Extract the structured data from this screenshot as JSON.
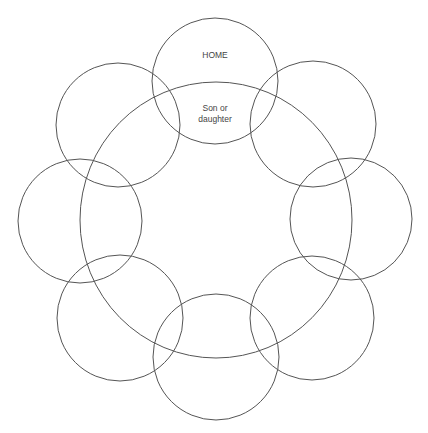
{
  "diagram": {
    "type": "overlapping-circles",
    "stroke_color": "#555555",
    "background": "#ffffff",
    "central_ellipse": {
      "cx": 216,
      "cy": 220,
      "rx": 136,
      "ry": 138
    },
    "circles": [
      {
        "id": "top",
        "cx": 215,
        "cy": 81,
        "r": 63,
        "label": "HOME"
      },
      {
        "id": "top-right",
        "cx": 313,
        "cy": 124,
        "r": 63,
        "label": ""
      },
      {
        "id": "right",
        "cx": 351,
        "cy": 219,
        "r": 61,
        "label": ""
      },
      {
        "id": "bottom-right",
        "cx": 312,
        "cy": 318,
        "r": 62,
        "label": ""
      },
      {
        "id": "bottom",
        "cx": 216,
        "cy": 357,
        "r": 63,
        "label": ""
      },
      {
        "id": "bottom-left",
        "cx": 120,
        "cy": 318,
        "r": 63,
        "label": ""
      },
      {
        "id": "left",
        "cx": 80,
        "cy": 221,
        "r": 62,
        "label": ""
      },
      {
        "id": "top-left",
        "cx": 118,
        "cy": 125,
        "r": 62,
        "label": ""
      }
    ],
    "labels": {
      "home": "HOME",
      "overlap_line1": "Son or",
      "overlap_line2": "daughter"
    },
    "caption_cutoff": ""
  }
}
